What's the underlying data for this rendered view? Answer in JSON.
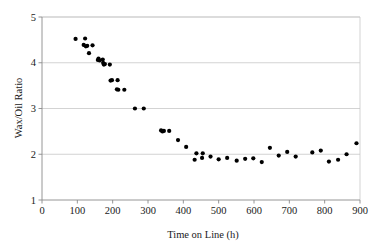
{
  "chart_data": {
    "type": "scatter",
    "title": "",
    "xlabel": "Time on Line (h)",
    "ylabel": "Wax/Oil Ratio",
    "xlim": [
      0,
      900
    ],
    "ylim": [
      1,
      5
    ],
    "xticks": [
      0,
      100,
      200,
      300,
      400,
      500,
      600,
      700,
      800,
      900
    ],
    "yticks": [
      1,
      2,
      3,
      4,
      5
    ],
    "xtick_labels": [
      "0",
      "100",
      "200",
      "300",
      "400",
      "500",
      "600",
      "700",
      "800",
      "900"
    ],
    "ytick_labels": [
      "1",
      "2",
      "3",
      "4",
      "5"
    ],
    "grid": "horizontal",
    "grid_color": "#c8c8c8",
    "legend": "none",
    "marker": "filled-circle",
    "marker_color": "#000000",
    "marker_size": 3.1,
    "series": [
      {
        "name": "Wax/Oil Ratio",
        "points": [
          [
            95,
            4.52
          ],
          [
            118,
            4.39
          ],
          [
            122,
            4.53
          ],
          [
            124,
            4.36
          ],
          [
            128,
            4.37
          ],
          [
            133,
            4.21
          ],
          [
            143,
            4.38
          ],
          [
            158,
            4.06
          ],
          [
            160,
            4.09
          ],
          [
            163,
            4.05
          ],
          [
            172,
            4.07
          ],
          [
            173,
            4.0
          ],
          [
            175,
            3.96
          ],
          [
            178,
            3.97
          ],
          [
            192,
            3.96
          ],
          [
            194,
            3.61
          ],
          [
            198,
            3.62
          ],
          [
            214,
            3.62
          ],
          [
            212,
            3.42
          ],
          [
            216,
            3.41
          ],
          [
            233,
            3.41
          ],
          [
            263,
            3.0
          ],
          [
            288,
            3.0
          ],
          [
            337,
            2.52
          ],
          [
            341,
            2.5
          ],
          [
            345,
            2.51
          ],
          [
            360,
            2.51
          ],
          [
            385,
            2.31
          ],
          [
            408,
            2.16
          ],
          [
            432,
            1.88
          ],
          [
            437,
            2.02
          ],
          [
            455,
            2.02
          ],
          [
            453,
            1.92
          ],
          [
            477,
            1.95
          ],
          [
            500,
            1.89
          ],
          [
            524,
            1.92
          ],
          [
            551,
            1.86
          ],
          [
            575,
            1.9
          ],
          [
            598,
            1.91
          ],
          [
            622,
            1.83
          ],
          [
            645,
            2.14
          ],
          [
            670,
            1.97
          ],
          [
            694,
            2.05
          ],
          [
            718,
            1.95
          ],
          [
            765,
            2.04
          ],
          [
            789,
            2.08
          ],
          [
            812,
            1.84
          ],
          [
            838,
            1.88
          ],
          [
            862,
            2.0
          ],
          [
            890,
            2.24
          ]
        ]
      }
    ]
  },
  "axes": {
    "x_title": "Time on Line (h)",
    "y_title": "Wax/Oil Ratio"
  }
}
